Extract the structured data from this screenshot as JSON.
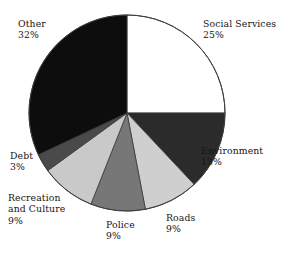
{
  "chart_data": {
    "type": "pie",
    "title": "",
    "subtitle": "",
    "xlabel": "",
    "ylabel": "",
    "legend_position": "none",
    "grid": false,
    "labels_outside": true,
    "center": {
      "x": 127,
      "y": 113
    },
    "radius": 98,
    "start_angle_deg": 0,
    "direction": "clockwise",
    "categories": [
      "Social Services",
      "Environment",
      "Roads",
      "Police",
      "Recreation and Culture",
      "Debt",
      "Other"
    ],
    "values": [
      25,
      13,
      9,
      9,
      9,
      3,
      32
    ],
    "value_unit": "%",
    "colors": [
      "#ffffff",
      "#2b2b2b",
      "#cfcfcf",
      "#777777",
      "#c9c9c9",
      "#4a4a4a",
      "#0d0d0d"
    ],
    "slices": [
      {
        "name": "Social Services",
        "value": 25,
        "value_label": "25%",
        "color": "#ffffff"
      },
      {
        "name": "Environment",
        "value": 13,
        "value_label": "13%",
        "color": "#2b2b2b"
      },
      {
        "name": "Roads",
        "value": 9,
        "value_label": "9%",
        "color": "#cfcfcf"
      },
      {
        "name": "Police",
        "value": 9,
        "value_label": "9%",
        "color": "#777777"
      },
      {
        "name": "Recreation and Culture",
        "value": 9,
        "value_label": "9%",
        "color": "#c9c9c9"
      },
      {
        "name": "Debt",
        "value": 3,
        "value_label": "3%",
        "color": "#4a4a4a"
      },
      {
        "name": "Other",
        "value": 32,
        "value_label": "32%",
        "color": "#0d0d0d"
      }
    ]
  },
  "labels": {
    "social_services": {
      "name": "Social Services",
      "pct": "25%"
    },
    "environment": {
      "name": "Environment",
      "pct": "13%"
    },
    "roads": {
      "name": "Roads",
      "pct": "9%"
    },
    "police": {
      "name": "Police",
      "pct": "9%"
    },
    "recreation": {
      "name_line1": "Recreation",
      "name_line2": "and Culture",
      "pct": "9%"
    },
    "debt": {
      "name": "Debt",
      "pct": "3%"
    },
    "other": {
      "name": "Other",
      "pct": "32%"
    }
  },
  "style": {
    "background": "#ffffff",
    "text_color": "#151515",
    "outline_color": "#3a3a3a"
  }
}
